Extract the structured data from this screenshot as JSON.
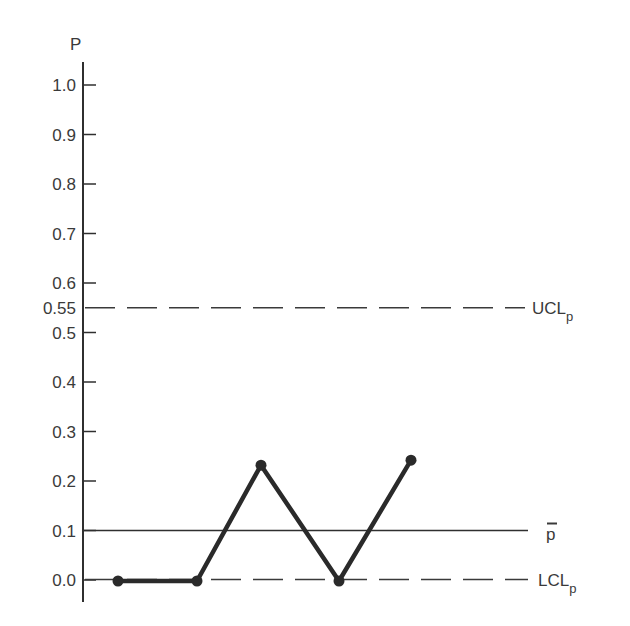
{
  "chart_data": {
    "type": "line",
    "title": "",
    "xlabel": "",
    "ylabel": "P",
    "ylim": [
      0.0,
      1.0
    ],
    "grid": false,
    "y_ticks": [
      0.0,
      0.1,
      0.2,
      0.3,
      0.4,
      0.5,
      0.6,
      0.7,
      0.8,
      0.9,
      1.0
    ],
    "y_tick_labels": [
      "0.0",
      "0.1",
      "0.2",
      "0.3",
      "0.4",
      "0.5",
      "0.6",
      "0.7",
      "0.8",
      "0.9",
      "1.0"
    ],
    "extra_y_tick_label": "0.55",
    "x": [
      1,
      2,
      3,
      4,
      5
    ],
    "series": [
      {
        "name": "p (sample proportion)",
        "values": [
          0.0,
          0.0,
          0.23,
          0.0,
          0.24
        ],
        "style": "solid-thick-with-markers"
      }
    ],
    "reference_lines": [
      {
        "name": "UCL",
        "label_main": "UCL",
        "label_sub": "p",
        "value": 0.55,
        "style": "dashed"
      },
      {
        "name": "center",
        "label_main": "p",
        "label_overbar": true,
        "value": 0.1,
        "style": "solid"
      },
      {
        "name": "LCL",
        "label_main": "LCL",
        "label_sub": "p",
        "value": 0.0,
        "style": "dashed"
      }
    ],
    "legend": "none"
  },
  "axis": {
    "y_title": "P"
  },
  "labels": {
    "ucl_main": "UCL",
    "ucl_sub": "p",
    "center": "p",
    "lcl_main": "LCL",
    "lcl_sub": "p",
    "ucl_value": "0.55"
  },
  "colors": {
    "ink": "#2a2a2a",
    "background": "#ffffff"
  }
}
